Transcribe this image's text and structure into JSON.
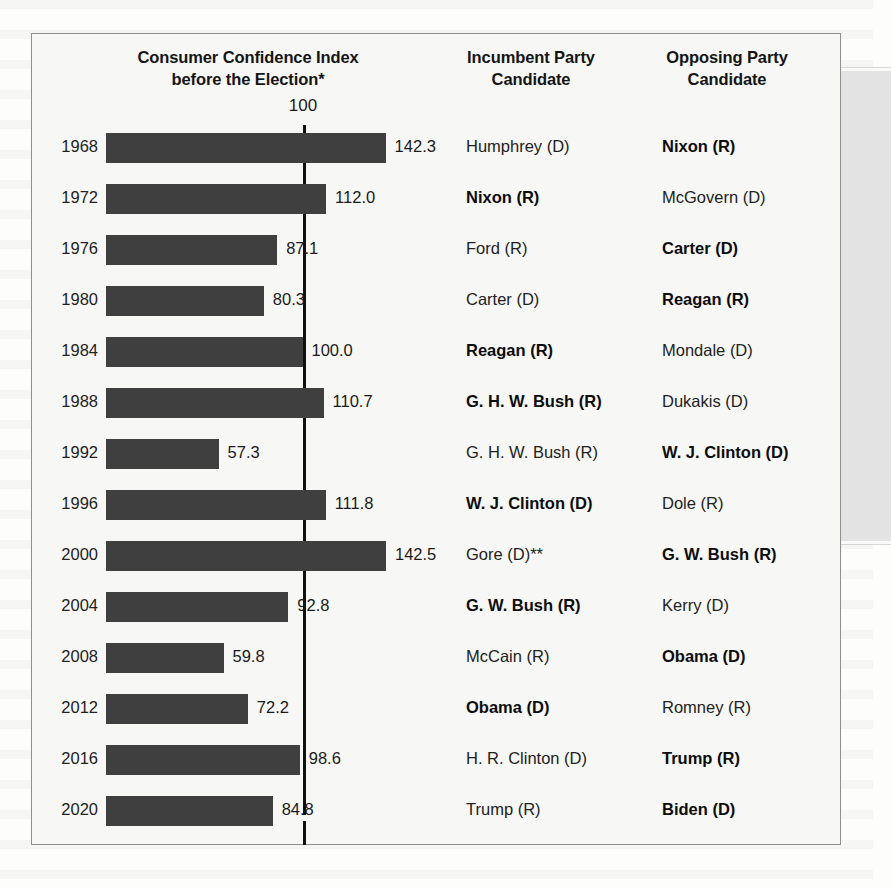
{
  "figure": {
    "headers": {
      "chart": "Consumer Confidence Index before the Election*",
      "chart_line1": "Consumer Confidence Index",
      "chart_line2": "before the Election*",
      "incumbent_line1": "Incumbent Party",
      "incumbent_line2": "Candidate",
      "opposing_line1": "Opposing Party",
      "opposing_line2": "Candidate"
    },
    "reference_label": "100",
    "colors": {
      "bar": "#3f3f3f",
      "reference_line": "#111111",
      "panel_background": "#f7f7f5",
      "frame_border": "#8e8e8e"
    }
  },
  "chart_data": {
    "type": "bar",
    "title": "Consumer Confidence Index before the Election*",
    "xlabel": "",
    "ylabel": "",
    "orientation": "horizontal",
    "reference_value": 100,
    "xlim": [
      0,
      150
    ],
    "grid": false,
    "legend": null,
    "categories": [
      "1968",
      "1972",
      "1976",
      "1980",
      "1984",
      "1988",
      "1992",
      "1996",
      "2000",
      "2004",
      "2008",
      "2012",
      "2016",
      "2020"
    ],
    "values": [
      142.3,
      112.0,
      87.1,
      80.3,
      100.0,
      110.7,
      57.3,
      111.8,
      142.5,
      92.8,
      59.8,
      72.2,
      98.6,
      84.8
    ],
    "value_labels": [
      "142.3",
      "112.0",
      "87.1",
      "80.3",
      "100.0",
      "110.7",
      "57.3",
      "111.8",
      "142.5",
      "92.8",
      "59.8",
      "72.2",
      "98.6",
      "84.8"
    ]
  },
  "rows": [
    {
      "year": "1968",
      "value": 142.3,
      "label": "142.3",
      "incumbent": "Humphrey (D)",
      "incumbent_won": false,
      "opposing": "Nixon (R)",
      "opposing_won": true
    },
    {
      "year": "1972",
      "value": 112.0,
      "label": "112.0",
      "incumbent": "Nixon (R)",
      "incumbent_won": true,
      "opposing": "McGovern (D)",
      "opposing_won": false
    },
    {
      "year": "1976",
      "value": 87.1,
      "label": "87.1",
      "incumbent": "Ford (R)",
      "incumbent_won": false,
      "opposing": "Carter (D)",
      "opposing_won": true
    },
    {
      "year": "1980",
      "value": 80.3,
      "label": "80.3",
      "incumbent": "Carter (D)",
      "incumbent_won": false,
      "opposing": "Reagan (R)",
      "opposing_won": true
    },
    {
      "year": "1984",
      "value": 100.0,
      "label": "100.0",
      "incumbent": "Reagan (R)",
      "incumbent_won": true,
      "opposing": "Mondale (D)",
      "opposing_won": false
    },
    {
      "year": "1988",
      "value": 110.7,
      "label": "110.7",
      "incumbent": "G. H. W. Bush (R)",
      "incumbent_won": true,
      "opposing": "Dukakis (D)",
      "opposing_won": false
    },
    {
      "year": "1992",
      "value": 57.3,
      "label": "57.3",
      "incumbent": "G. H. W. Bush (R)",
      "incumbent_won": false,
      "opposing": "W. J. Clinton (D)",
      "opposing_won": true
    },
    {
      "year": "1996",
      "value": 111.8,
      "label": "111.8",
      "incumbent": "W. J. Clinton (D)",
      "incumbent_won": true,
      "opposing": "Dole (R)",
      "opposing_won": false
    },
    {
      "year": "2000",
      "value": 142.5,
      "label": "142.5",
      "incumbent": "Gore (D)**",
      "incumbent_won": false,
      "opposing": "G. W. Bush (R)",
      "opposing_won": true
    },
    {
      "year": "2004",
      "value": 92.8,
      "label": "92.8",
      "incumbent": "G. W. Bush (R)",
      "incumbent_won": true,
      "opposing": "Kerry (D)",
      "opposing_won": false
    },
    {
      "year": "2008",
      "value": 59.8,
      "label": "59.8",
      "incumbent": "McCain (R)",
      "incumbent_won": false,
      "opposing": "Obama (D)",
      "opposing_won": true
    },
    {
      "year": "2012",
      "value": 72.2,
      "label": "72.2",
      "incumbent": "Obama (D)",
      "incumbent_won": true,
      "opposing": "Romney (R)",
      "opposing_won": false
    },
    {
      "year": "2016",
      "value": 98.6,
      "label": "98.6",
      "incumbent": "H. R. Clinton (D)",
      "incumbent_won": false,
      "opposing": "Trump (R)",
      "opposing_won": true
    },
    {
      "year": "2020",
      "value": 84.8,
      "label": "84.8",
      "incumbent": "Trump (R)",
      "incumbent_won": false,
      "opposing": "Biden (D)",
      "opposing_won": true
    }
  ]
}
